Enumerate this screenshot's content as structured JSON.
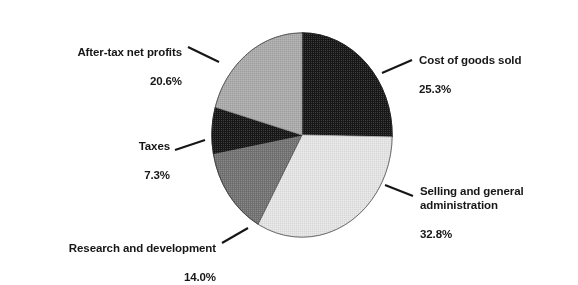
{
  "chart_data": {
    "type": "pie",
    "title": "",
    "subtitle": "",
    "xlabel": "",
    "ylabel": "",
    "legend_position": "none",
    "grid": false,
    "units": "percent",
    "start_angle_deg": 0,
    "direction": "clockwise",
    "categories": [
      "Cost of goods sold",
      "Selling and general administration",
      "Research and development",
      "Taxes",
      "After-tax net profits"
    ],
    "values": [
      25.3,
      32.8,
      14.0,
      7.3,
      20.6
    ],
    "slices": [
      {
        "label": "Cost of goods sold",
        "value": 25.3,
        "value_text": "25.3%",
        "color": "#1c1c1c",
        "start_deg": 0.0,
        "end_deg": 91.08
      },
      {
        "label": "Selling and general administration",
        "value": 32.8,
        "value_text": "32.8%",
        "color": "#e0e0e0",
        "start_deg": 91.08,
        "end_deg": 209.16
      },
      {
        "label": "Research and development",
        "value": 14.0,
        "value_text": "14.0%",
        "color": "#737373",
        "start_deg": 209.16,
        "end_deg": 259.56
      },
      {
        "label": "Taxes",
        "value": 7.3,
        "value_text": "7.3%",
        "color": "#1c1c1c",
        "start_deg": 259.56,
        "end_deg": 285.84
      },
      {
        "label": "After-tax net profits",
        "value": 20.6,
        "value_text": "20.6%",
        "color": "#a8a8a8",
        "start_deg": 285.84,
        "end_deg": 360.0
      }
    ]
  },
  "labels": {
    "after_tax_net_profits": {
      "name": "After-tax net profits",
      "pct": "20.6%"
    },
    "taxes": {
      "name": "Taxes",
      "pct": "7.3%"
    },
    "research_and_development": {
      "name": "Research and development",
      "pct": "14.0%"
    },
    "cost_of_goods_sold": {
      "name": "Cost of goods sold",
      "pct": "25.3%"
    },
    "selling_and_general_administration": {
      "name": "Selling and general\nadministration",
      "pct": "32.8%"
    }
  },
  "colors": {
    "cost_of_goods_sold": "#1c1c1c",
    "selling_and_general_administration": "#e0e0e0",
    "research_and_development": "#737373",
    "taxes": "#1c1c1c",
    "after_tax_net_profits": "#a8a8a8",
    "outline": "#141414",
    "text": "#171717",
    "background": "#ffffff"
  }
}
